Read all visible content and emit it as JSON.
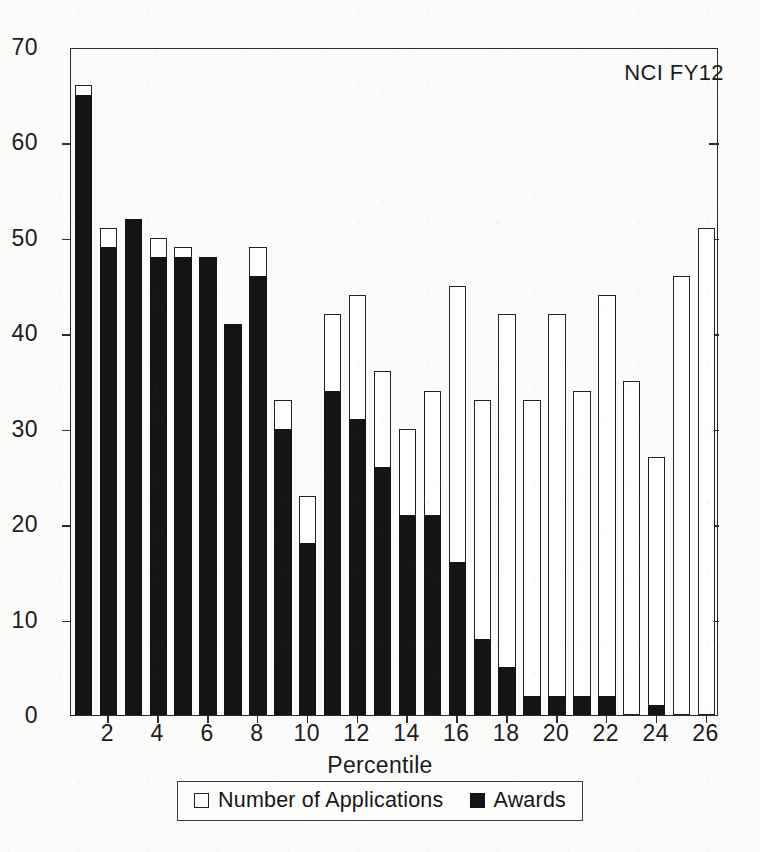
{
  "chart_data": {
    "type": "bar",
    "subtype": "overlaid-stacked",
    "title": "",
    "annotation": "NCI FY12",
    "xlabel": "Percentile",
    "ylabel": "",
    "ylim": [
      0,
      70
    ],
    "y_ticks": [
      0,
      10,
      20,
      30,
      40,
      50,
      60,
      70
    ],
    "xlim": [
      0.5,
      26.5
    ],
    "x_ticks": [
      2,
      4,
      6,
      8,
      10,
      12,
      14,
      16,
      18,
      20,
      22,
      24,
      26
    ],
    "grid": false,
    "legend_position": "bottom-center",
    "categories": [
      1,
      2,
      3,
      4,
      5,
      6,
      7,
      8,
      9,
      10,
      11,
      12,
      13,
      14,
      15,
      16,
      17,
      18,
      19,
      20,
      21,
      22,
      23,
      24,
      25,
      26
    ],
    "series": [
      {
        "name": "Number of Applications",
        "style": "open",
        "color": "#ffffff",
        "edge_color": "#222222",
        "values": [
          66,
          51,
          52,
          50,
          49,
          48,
          41,
          49,
          33,
          23,
          42,
          44,
          36,
          30,
          34,
          45,
          33,
          42,
          33,
          42,
          34,
          44,
          35,
          27,
          46,
          51
        ]
      },
      {
        "name": "Awards",
        "style": "filled",
        "color": "#141414",
        "edge_color": "#141414",
        "values": [
          65,
          49,
          52,
          48,
          48,
          48,
          41,
          46,
          30,
          18,
          34,
          31,
          26,
          21,
          21,
          16,
          8,
          5,
          2,
          2,
          2,
          2,
          0,
          1,
          0,
          0
        ]
      }
    ]
  },
  "legend": {
    "entries": [
      {
        "label": "Number of Applications",
        "swatch": "open-square-icon"
      },
      {
        "label": "Awards",
        "swatch": "filled-square-icon"
      }
    ]
  }
}
